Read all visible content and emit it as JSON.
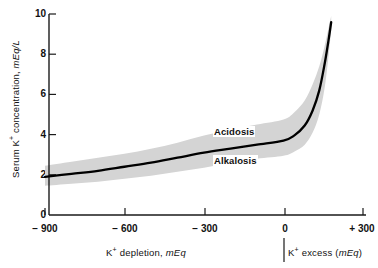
{
  "chart_data": {
    "type": "line",
    "title": "",
    "subtitle": "",
    "xlabel_left": "K⁺ depletion, mEq",
    "xlabel_right": "K⁺ excess (mEq)",
    "ylabel": "Serum K⁺ concentration, mEq/L",
    "xlim": [
      -900,
      300
    ],
    "ylim": [
      0,
      10
    ],
    "xticks": [
      -900,
      -600,
      -300,
      0,
      300
    ],
    "xtick_labels": [
      "− 900",
      "− 600",
      "− 300",
      "0",
      "+ 300"
    ],
    "yticks": [
      0,
      2,
      4,
      6,
      8,
      10
    ],
    "ytick_labels": [
      "0",
      "2",
      "4",
      "6",
      "8",
      "10"
    ],
    "grid": false,
    "legend": "none",
    "series": [
      {
        "name": "Serum K+ concentration",
        "x": [
          -900,
          -800,
          -700,
          -600,
          -500,
          -400,
          -300,
          -200,
          -100,
          0,
          40,
          80,
          110,
          135,
          155,
          170,
          180
        ],
        "values": [
          1.9,
          2.05,
          2.2,
          2.4,
          2.6,
          2.85,
          3.1,
          3.3,
          3.5,
          3.7,
          3.95,
          4.45,
          5.2,
          6.2,
          7.5,
          8.7,
          9.6
        ]
      }
    ],
    "band": {
      "name": "normal range band",
      "x": [
        -900,
        -800,
        -700,
        -600,
        -500,
        -400,
        -300,
        -200,
        -100,
        0,
        40,
        80,
        110,
        135,
        155,
        170,
        180
      ],
      "upper": [
        2.45,
        2.65,
        2.85,
        3.05,
        3.3,
        3.6,
        3.95,
        4.25,
        4.5,
        4.75,
        5.1,
        5.7,
        6.5,
        7.4,
        8.4,
        9.3,
        9.9
      ],
      "lower": [
        1.45,
        1.55,
        1.65,
        1.8,
        1.95,
        2.15,
        2.35,
        2.6,
        2.8,
        2.95,
        3.15,
        3.5,
        4.1,
        5.0,
        6.3,
        7.9,
        9.2
      ]
    },
    "annotations": [
      {
        "text": "Acidosis",
        "x": -210,
        "y": 4.1,
        "position": "above-curve"
      },
      {
        "text": "Alkalosis",
        "x": -210,
        "y": 2.75,
        "position": "below-curve"
      }
    ],
    "colors": {
      "axis": "#1a1a1a",
      "curve": "#000000",
      "band": "#d2d2d2",
      "background": "#ffffff"
    }
  },
  "axes": {
    "y_title_text": "Serum K",
    "y_title_sup": "+",
    "y_title_rest": " concentration, ",
    "y_title_unit": "mEq/L",
    "x_caption_left_main": "K",
    "x_caption_left_sup": "+",
    "x_caption_left_rest": " depletion, ",
    "x_caption_left_unit": "mEq",
    "x_caption_right_main": "K",
    "x_caption_right_sup": "+",
    "x_caption_right_rest": " excess (",
    "x_caption_right_unit": "mEq",
    "x_caption_right_tail": ")"
  },
  "ytick_0": "0",
  "ytick_1": "2",
  "ytick_2": "4",
  "ytick_3": "6",
  "ytick_4": "8",
  "ytick_5": "10",
  "xtick_0": "− 900",
  "xtick_1": "− 600",
  "xtick_2": "− 300",
  "xtick_3": "0",
  "xtick_4": "+ 300",
  "annotation_acidosis": "Acidosis",
  "annotation_alkalosis": "Alkalosis"
}
